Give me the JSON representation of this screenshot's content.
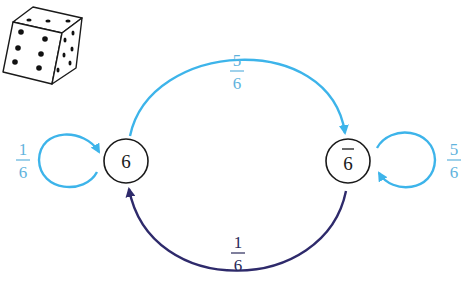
{
  "diagram": {
    "type": "markov-chain",
    "die": {
      "icon": "die-icon",
      "top_face_pips": 3,
      "front_face_pips": 6,
      "right_face_pips": 6
    },
    "nodes": [
      {
        "id": "six",
        "label": "6"
      },
      {
        "id": "not-six",
        "label": "6",
        "overline": true
      }
    ],
    "edges": [
      {
        "from": "six",
        "to": "six",
        "numerator": "1",
        "denominator": "6",
        "color": "#3db4ea"
      },
      {
        "from": "six",
        "to": "not-six",
        "numerator": "5",
        "denominator": "6",
        "color": "#3db4ea"
      },
      {
        "from": "not-six",
        "to": "not-six",
        "numerator": "5",
        "denominator": "6",
        "color": "#3db4ea"
      },
      {
        "from": "not-six",
        "to": "six",
        "numerator": "1",
        "denominator": "6",
        "color": "#2e2a6b"
      }
    ],
    "colors": {
      "light_arrow": "#3db4ea",
      "dark_arrow": "#2e2a6b",
      "light_text": "#5fb3dd",
      "dark_text": "#2a2a5a",
      "node_stroke": "#1a1a1a"
    }
  }
}
